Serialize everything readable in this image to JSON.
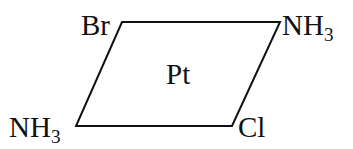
{
  "figure": {
    "kind": "chemical-structure-diagram",
    "background_color": "#ffffff",
    "stroke_color": "#111111",
    "stroke_width": 2
  },
  "geometry": {
    "vertices": {
      "top_left": {
        "x": 122,
        "y": 22
      },
      "top_right": {
        "x": 280,
        "y": 22
      },
      "bottom_right": {
        "x": 232,
        "y": 126
      },
      "bottom_left": {
        "x": 76,
        "y": 126
      }
    },
    "path": "M 122 22 L 280 22 L 232 126 L 76 126 Z"
  },
  "labels": {
    "center_metal": "Pt",
    "top_left_ligand": "Br",
    "top_right_ligand": {
      "text": "NH",
      "subscript": "3"
    },
    "bottom_left_ligand": {
      "text": "NH",
      "subscript": "3"
    },
    "bottom_right_ligand": "Cl"
  }
}
